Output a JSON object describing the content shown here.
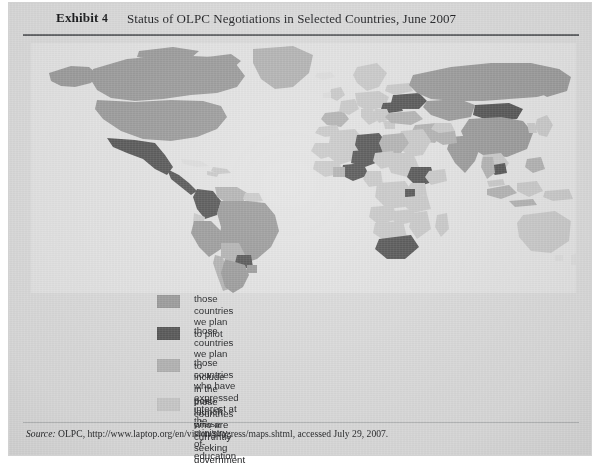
{
  "exhibit": {
    "label": "Exhibit",
    "number": "4",
    "title": "Status of OLPC Negotiations in Selected Countries, June 2007"
  },
  "legend": {
    "items": [
      {
        "label": "those countries we plan to pilot",
        "color": "#9a9a9a"
      },
      {
        "label": "those countries we plan to include in the post-launch phase",
        "color": "#565656"
      },
      {
        "label": "those countries who have expressed interest at\nthe ministry-of-education level or higher",
        "color": "#b2b2b2"
      },
      {
        "label": "those countries who are currently seeking government support",
        "color": "#c9c9c9"
      }
    ]
  },
  "source": {
    "prefix": "Source:",
    "text": " OLPC, http://www.laptop.org/en/vision/progress/maps.shtml, accessed July 29, 2007."
  },
  "map": {
    "ocean_color": "#e2e2e2",
    "unlisted_land_color": "#dcdcdc",
    "chart_type": "choropleth-world-map",
    "categories": [
      {
        "key": "pilot",
        "color": "#9a9a9a",
        "label": "those countries we plan to pilot"
      },
      {
        "key": "post_launch",
        "color": "#565656",
        "label": "those countries we plan to include in the post-launch phase"
      },
      {
        "key": "ministry_interest",
        "color": "#b2b2b2",
        "label": "those countries who have expressed interest at the ministry-of-education level or higher"
      },
      {
        "key": "seeking_support",
        "color": "#c9c9c9",
        "label": "those countries who are currently seeking government support"
      }
    ],
    "countries": {
      "pilot": [
        "United States",
        "Canada",
        "Russia",
        "Brazil",
        "Peru",
        "Argentina",
        "Uruguay",
        "China",
        "India",
        "Kazakhstan"
      ],
      "post_launch": [
        "Mexico",
        "Colombia",
        "Paraguay",
        "Nigeria",
        "Niger",
        "Ethiopia",
        "Rwanda",
        "South Africa",
        "Mongolia",
        "Cambodia",
        "Libya",
        "Ukraine",
        "Romania"
      ],
      "ministry_interest": [
        "Venezuela",
        "Chile",
        "Bolivia",
        "Egypt",
        "Turkey",
        "Iran",
        "Pakistan",
        "Thailand",
        "Indonesia",
        "Philippines",
        "Spain",
        "Portugal",
        "Greenland"
      ],
      "seeking_support": [
        "Algeria",
        "Mali",
        "Chad",
        "Sudan",
        "Kenya",
        "Tanzania",
        "Angola",
        "Zambia",
        "Mozambique",
        "Madagascar",
        "Saudi Arabia",
        "Australia",
        "Papua New Guinea"
      ]
    }
  }
}
